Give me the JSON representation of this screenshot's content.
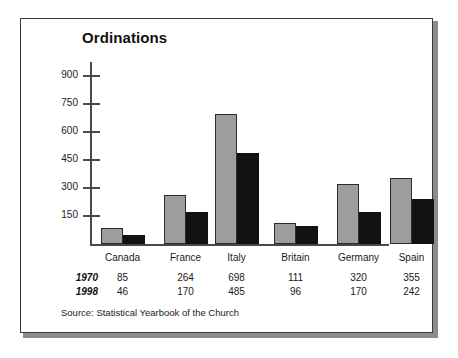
{
  "chart_data": {
    "type": "bar",
    "title": "Ordinations",
    "xlabel": "",
    "ylabel": "",
    "ylim": [
      0,
      975
    ],
    "grid": false,
    "legend_position": "none",
    "categories": [
      "Canada",
      "France",
      "Italy",
      "Britain",
      "Germany",
      "Spain"
    ],
    "yticks": [
      150,
      300,
      450,
      600,
      750,
      900
    ],
    "ytick_labels": [
      "150",
      "300",
      "450",
      "600",
      "750",
      "900"
    ],
    "series": [
      {
        "name": "1970",
        "color": "#9d9d9d",
        "values": [
          85,
          264,
          698,
          111,
          320,
          355
        ]
      },
      {
        "name": "1998",
        "color": "#121212",
        "values": [
          46,
          170,
          485,
          96,
          170,
          242
        ]
      }
    ],
    "source_note": "Source: Statistical Yearbook of the Church"
  },
  "table": {
    "row_labels": [
      "1970",
      "1998"
    ],
    "columns": [
      "Canada",
      "France",
      "Italy",
      "Britain",
      "Germany",
      "Spain"
    ],
    "rows": [
      [
        "85",
        "264",
        "698",
        "111",
        "320",
        "355"
      ],
      [
        "46",
        "170",
        "485",
        "96",
        "170",
        "242"
      ]
    ]
  }
}
